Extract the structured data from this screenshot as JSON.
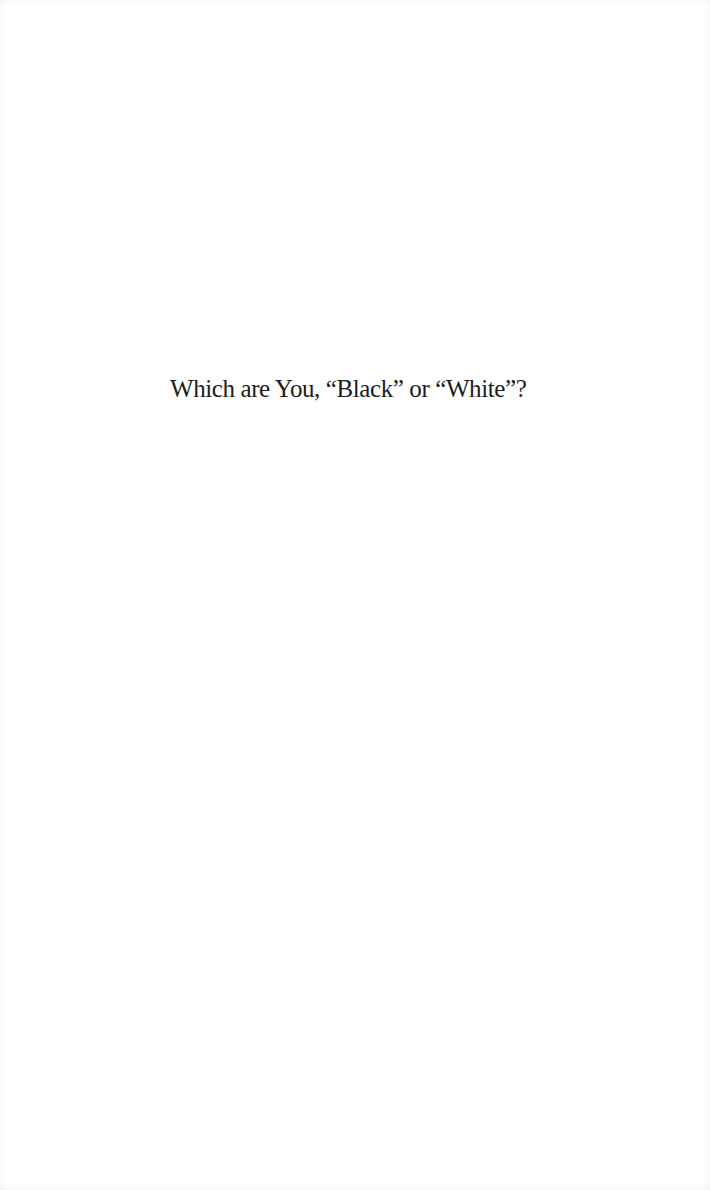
{
  "page": {
    "half_title": "Which are You, “Black” or “White”?"
  }
}
